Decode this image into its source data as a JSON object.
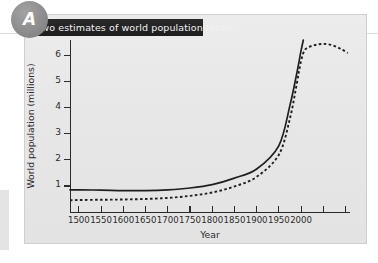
{
  "badge": {
    "letter": "A"
  },
  "title": {
    "text": "Two estimates of world population totals"
  },
  "chart_data": {
    "type": "line",
    "title": "Two estimates of world population totals",
    "xlabel": "Year",
    "ylabel": "World population (millions)",
    "xlim": [
      1480,
      2110
    ],
    "ylim": [
      0,
      6.6
    ],
    "grid": false,
    "legend": "none",
    "x_ticks": [
      1500,
      1550,
      1600,
      1650,
      1700,
      1750,
      1800,
      1850,
      1900,
      1950,
      2000,
      2050,
      2100
    ],
    "x_tick_labels": [
      "1500",
      "1550",
      "1600",
      "1650",
      "1700",
      "1750",
      "1800",
      "1850",
      "1900",
      "1950",
      "2000",
      "",
      ""
    ],
    "y_ticks": [
      1,
      2,
      3,
      4,
      5,
      6
    ],
    "y_tick_labels": [
      "1",
      "2",
      "3",
      "4",
      "5",
      "6"
    ],
    "series": [
      {
        "name": "solid-estimate",
        "style": "solid",
        "color": "#1f1f1f",
        "x": [
          1480,
          1500,
          1550,
          1600,
          1650,
          1700,
          1750,
          1800,
          1850,
          1900,
          1950,
          1975,
          1990,
          2000,
          2005
        ],
        "values": [
          0.85,
          0.85,
          0.84,
          0.82,
          0.82,
          0.85,
          0.92,
          1.05,
          1.3,
          1.65,
          2.55,
          4.1,
          5.3,
          6.2,
          6.6
        ]
      },
      {
        "name": "dashed-estimate",
        "style": "dashed",
        "color": "#1f1f1f",
        "x": [
          1480,
          1500,
          1550,
          1600,
          1650,
          1700,
          1750,
          1800,
          1850,
          1900,
          1950,
          1975,
          1990,
          2000,
          2010,
          2030,
          2050,
          2070,
          2090,
          2105
        ],
        "values": [
          0.45,
          0.46,
          0.47,
          0.48,
          0.5,
          0.54,
          0.62,
          0.75,
          0.98,
          1.35,
          2.2,
          3.6,
          4.9,
          5.8,
          6.25,
          6.4,
          6.45,
          6.4,
          6.25,
          6.1
        ]
      }
    ]
  }
}
